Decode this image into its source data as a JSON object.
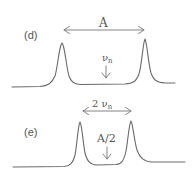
{
  "panels": [
    {
      "id": "d",
      "label": "(d)",
      "arrow_label": "A",
      "center_label": "ν",
      "center_label_sub": "n",
      "description": "Two sharp peaks separated by splitting A; ν_n marks the center"
    },
    {
      "id": "e",
      "label": "(e)",
      "arrow_label_prefix": "2 ",
      "arrow_label": "ν",
      "arrow_label_sub": "n",
      "center_label": "A/2",
      "description": "Two peaks separated by 2ν_n; A/2 marks the center"
    }
  ],
  "colors": {
    "line": "#6a6a6a",
    "text": "#555555",
    "background": "#ffffff"
  }
}
